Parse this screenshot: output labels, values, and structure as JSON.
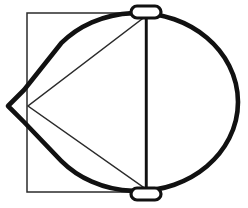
{
  "figure": {
    "background_color": "#ffffff",
    "thick_stroke_color": "#111111",
    "thin_stroke_color": "#2b2b2b",
    "thick_stroke_width": 4.6,
    "thin_stroke_width": 1.5,
    "canvas": {
      "width": 248,
      "height": 208
    }
  },
  "shapes": {
    "square": {
      "name": "square-outline",
      "x": 27,
      "y": 13,
      "width": 120,
      "height": 179,
      "stroke": "#2b2b2b"
    },
    "blob": {
      "name": "circle-with-left-spike",
      "center_x": 137,
      "center_y": 102,
      "radius_x": 101,
      "radius_y": 89,
      "spike_tip_x": 8,
      "spike_tip_y": 106,
      "stroke": "#111111"
    },
    "triangle": {
      "name": "inscribed-triangle",
      "vertices": [
        {
          "x": 146,
          "y": 16
        },
        {
          "x": 146,
          "y": 189
        },
        {
          "x": 28,
          "y": 106
        }
      ],
      "stroke": "#2b2b2b"
    },
    "axis_line": {
      "name": "vertical-axis-line",
      "x": 146,
      "y1": 16,
      "y2": 189,
      "stroke": "#111111"
    },
    "cap_top": {
      "name": "top-oval-cap",
      "center_x": 146,
      "center_y": 12,
      "width": 30,
      "height": 12
    },
    "cap_bottom": {
      "name": "bottom-oval-cap",
      "center_x": 146,
      "center_y": 194,
      "width": 30,
      "height": 12
    }
  },
  "chart_data": {
    "type": "diagram",
    "elements": [
      {
        "label": "square",
        "kind": "rectangle"
      },
      {
        "label": "circle with left spike",
        "kind": "closed-curve"
      },
      {
        "label": "inscribed triangle",
        "kind": "polygon"
      },
      {
        "label": "vertical axis",
        "kind": "line"
      },
      {
        "label": "top oval cap",
        "kind": "ellipse"
      },
      {
        "label": "bottom oval cap",
        "kind": "ellipse"
      }
    ]
  }
}
